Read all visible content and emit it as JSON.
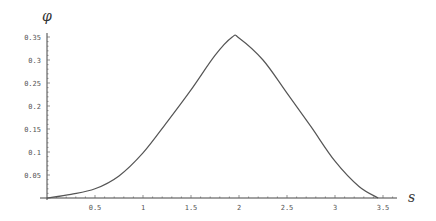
{
  "chart_data": {
    "type": "line",
    "title": "",
    "xlabel": "s",
    "ylabel": "φ",
    "xlim": [
      0,
      3.6
    ],
    "ylim": [
      0,
      0.36
    ],
    "grid": false,
    "x_ticks": [
      0.5,
      1,
      1.5,
      2,
      2.5,
      3,
      3.5
    ],
    "x_tick_labels": [
      "0.5",
      "1",
      "1.5",
      "2",
      "2.5",
      "3",
      "3.5"
    ],
    "y_ticks": [
      0.05,
      0.1,
      0.15,
      0.2,
      0.25,
      0.3,
      0.35
    ],
    "y_tick_labels": [
      "0.05",
      "0.1",
      "0.15",
      "0.2",
      "0.25",
      "0.3",
      "0.35"
    ],
    "series": [
      {
        "name": "phi(s)",
        "color": "#555555",
        "x": [
          0,
          0.25,
          0.5,
          0.75,
          1.0,
          1.25,
          1.5,
          1.75,
          1.93,
          2.0,
          2.25,
          2.5,
          2.75,
          3.0,
          3.25,
          3.45
        ],
        "y": [
          0,
          0.008,
          0.02,
          0.048,
          0.098,
          0.165,
          0.235,
          0.31,
          0.35,
          0.348,
          0.3,
          0.228,
          0.155,
          0.08,
          0.025,
          0
        ]
      }
    ]
  }
}
